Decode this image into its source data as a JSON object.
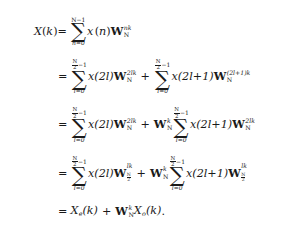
{
  "document": {
    "type": "mathematical-derivation",
    "subject": "Decimation-in-time FFT derivation of the DFT",
    "background_color": "#ffffff",
    "text_color": "#1a1a1a"
  },
  "symbols": {
    "X": "X",
    "x": "x",
    "W": "W",
    "N": "N",
    "n": "n",
    "k": "k",
    "l": "l",
    "equals": "=",
    "plus": "+",
    "period": ".",
    "open_paren": "(",
    "close_paren": ")",
    "sigma": "∑",
    "two": "2",
    "one": "1",
    "zero": "0",
    "N_minus_1": "N−1",
    "n_equals_0": "n=0",
    "l_equals_0": "l=0",
    "minus_1": "−1",
    "sub_e": "e",
    "sub_o": "o"
  },
  "lines": [
    {
      "id": "line-1",
      "label": "dft-definition",
      "latex": "X(k) = \\sum_{n=0}^{N-1} x(n) W_N^{nk}",
      "lhs": "X(k)",
      "sum_upper": "N−1",
      "sum_lower": "n=0",
      "term_function": "x(n)",
      "twiddle_sub": "N",
      "twiddle_sup": "nk"
    },
    {
      "id": "line-2",
      "label": "split-even-odd",
      "latex": "= \\sum_{l=0}^{\\frac{N}{2}-1} x(2l) W_N^{2lk} + \\sum_{l=0}^{\\frac{N}{2}-1} x(2l+1) W_N^{(2l+1)k}",
      "sum_upper_num": "N",
      "sum_upper_den": "2",
      "sum_upper_tail": "−1",
      "sum_lower": "l=0",
      "term1_function": "x(2l)",
      "term1_twiddle_sub": "N",
      "term1_twiddle_sup": "2lk",
      "term2_function": "x(2l+1)",
      "term2_twiddle_sub": "N",
      "term2_twiddle_sup": "(2l+1)k"
    },
    {
      "id": "line-3",
      "label": "factor-twiddle",
      "latex": "= \\sum_{l=0}^{\\frac{N}{2}-1} x(2l) W_N^{2lk} + W_N^{k} \\sum_{l=0}^{\\frac{N}{2}-1} x(2l+1) W_N^{2lk}",
      "sum_upper_num": "N",
      "sum_upper_den": "2",
      "sum_upper_tail": "−1",
      "sum_lower": "l=0",
      "term1_function": "x(2l)",
      "term1_twiddle_sub": "N",
      "term1_twiddle_sup": "2lk",
      "factor_twiddle_sub": "N",
      "factor_twiddle_sup": "k",
      "term2_function": "x(2l+1)",
      "term2_twiddle_sub": "N",
      "term2_twiddle_sup": "2lk"
    },
    {
      "id": "line-4",
      "label": "half-length-twiddle",
      "latex": "= \\sum_{l=0}^{\\frac{N}{2}-1} x(2l) W_{\\frac{N}{2}}^{lk} + W_N^{k} \\sum_{l=0}^{\\frac{N}{2}-1} x(2l+1) W_{\\frac{N}{2}}^{lk}",
      "sum_upper_num": "N",
      "sum_upper_den": "2",
      "sum_upper_tail": "−1",
      "sum_lower": "l=0",
      "term1_function": "x(2l)",
      "term1_twiddle_sub_num": "N",
      "term1_twiddle_sub_den": "2",
      "term1_twiddle_sup": "lk",
      "factor_twiddle_sub": "N",
      "factor_twiddle_sup": "k",
      "term2_function": "x(2l+1)",
      "term2_twiddle_sub_num": "N",
      "term2_twiddle_sub_den": "2",
      "term2_twiddle_sup": "lk"
    },
    {
      "id": "line-5",
      "label": "even-odd-result",
      "latex": "= X_e(k) + W_N^{k} X_o(k).",
      "even_term": "X",
      "even_sub": "e",
      "even_arg": "(k)",
      "factor_twiddle_sub": "N",
      "factor_twiddle_sup": "k",
      "odd_term": "X",
      "odd_sub": "o",
      "odd_arg": "(k)",
      "terminator": "."
    }
  ]
}
